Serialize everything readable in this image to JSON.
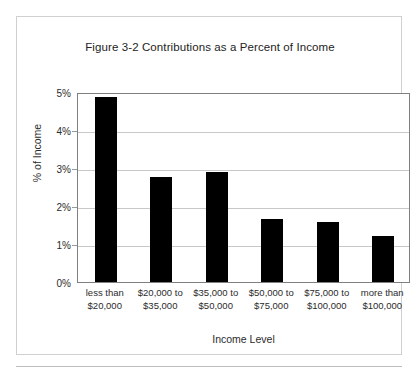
{
  "figure": {
    "title": "Figure 3-2 Contributions as a Percent of Income",
    "frame_color": "#d0d0d0",
    "bar_color": "#000000",
    "gridline_color": "#c8c8c8",
    "axis_color": "#808080"
  },
  "chart_data": {
    "type": "bar",
    "title": "Figure 3-2 Contributions as a Percent of Income",
    "xlabel": "Income Level",
    "ylabel": "% of Income",
    "categories": [
      "less than $20,000",
      "$20,000 to $35,000",
      "$35,000 to $50,000",
      "$50,000 to $75,000",
      "$75,000 to $100,000",
      "more than $100,000"
    ],
    "category_lines": [
      [
        "less than",
        "$20,000"
      ],
      [
        "$20,000 to",
        "$35,000"
      ],
      [
        "$35,000 to",
        "$50,000"
      ],
      [
        "$50,000 to",
        "$75,000"
      ],
      [
        "$75,000 to",
        "$100,000"
      ],
      [
        "more than",
        "$100,000"
      ]
    ],
    "values": [
      4.87,
      2.76,
      2.89,
      1.66,
      1.58,
      1.21
    ],
    "ylim": [
      0,
      5
    ],
    "ytick_values": [
      0,
      1,
      2,
      3,
      4,
      5
    ],
    "ytick_labels": [
      "0%",
      "1%",
      "2%",
      "3%",
      "4%",
      "5%"
    ],
    "grid": true,
    "legend": false
  }
}
